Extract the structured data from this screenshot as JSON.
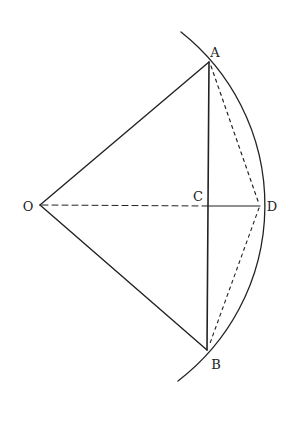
{
  "diagram": {
    "type": "geometry",
    "colors": {
      "stroke": "#222222",
      "background": "#ffffff"
    },
    "points": {
      "O": {
        "label": "O",
        "x": 40,
        "y": 205,
        "label_x": 28,
        "label_y": 206
      },
      "A": {
        "label": "A",
        "x": 209,
        "y": 62,
        "label_x": 215,
        "label_y": 52
      },
      "B": {
        "label": "B",
        "x": 207,
        "y": 350,
        "label_x": 216,
        "label_y": 364
      },
      "C": {
        "label": "C",
        "x": 209,
        "y": 206,
        "label_x": 198,
        "label_y": 196
      },
      "D": {
        "label": "D",
        "x": 260,
        "y": 206,
        "label_x": 272,
        "label_y": 206
      }
    },
    "arc": {
      "center": "O",
      "radius": 221,
      "start": [
        181,
        32
      ],
      "end": [
        178,
        381
      ]
    },
    "segments": [
      {
        "from": "O",
        "to": "A",
        "style": "solid"
      },
      {
        "from": "O",
        "to": "B",
        "style": "solid"
      },
      {
        "from": "A",
        "to": "B",
        "style": "solid"
      },
      {
        "from": "C",
        "to": "D",
        "style": "solid"
      },
      {
        "from": "O",
        "to": "C",
        "style": "dashed"
      },
      {
        "from": "A",
        "to": "D",
        "style": "dotted"
      },
      {
        "from": "D",
        "to": "B",
        "style": "dotted"
      }
    ]
  }
}
